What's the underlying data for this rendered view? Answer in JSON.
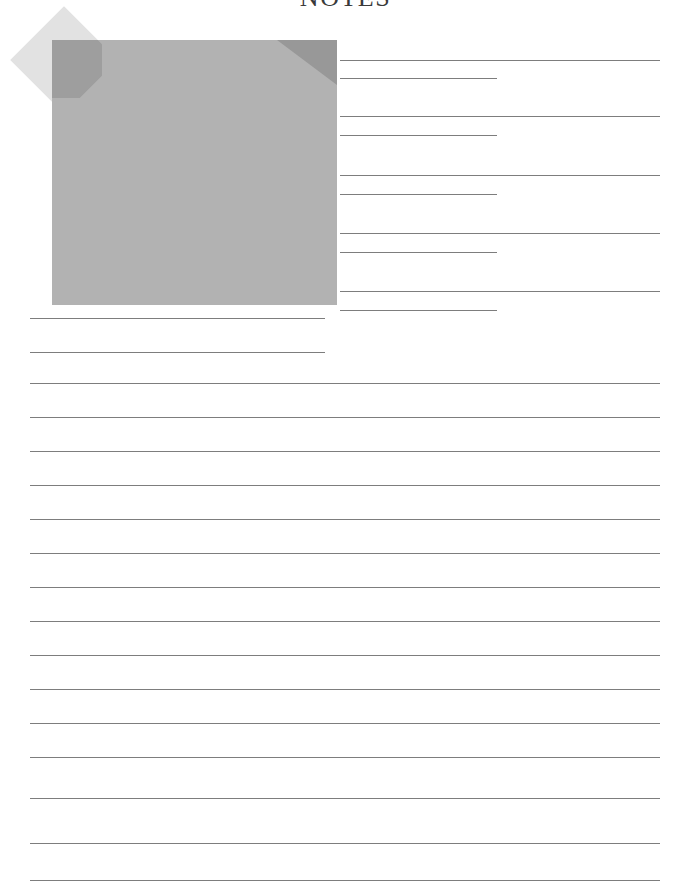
{
  "page": {
    "title": "NOTES",
    "width": 691,
    "height": 883,
    "background_color": "#ffffff",
    "title_color": "#3a3a3a"
  },
  "note_graphic": {
    "name": "sticky-note-illustration",
    "body_color": "#b2b2b2",
    "fold_color": "#989898",
    "tape_color": "#e2e2e2",
    "overlap_color": "#9e9e9e"
  },
  "rules": {
    "line_color": "#7d7d7d",
    "right_column": [
      {
        "type": "long",
        "x": 340,
        "width": 320,
        "y": 60
      },
      {
        "type": "short",
        "x": 340,
        "width": 157,
        "y": 78
      },
      {
        "type": "long",
        "x": 340,
        "width": 320,
        "y": 116
      },
      {
        "type": "short",
        "x": 340,
        "width": 157,
        "y": 135
      },
      {
        "type": "long",
        "x": 340,
        "width": 320,
        "y": 175
      },
      {
        "type": "short",
        "x": 340,
        "width": 157,
        "y": 194
      },
      {
        "type": "long",
        "x": 340,
        "width": 320,
        "y": 233
      },
      {
        "type": "short",
        "x": 340,
        "width": 157,
        "y": 252
      },
      {
        "type": "long",
        "x": 340,
        "width": 320,
        "y": 291
      },
      {
        "type": "short",
        "x": 340,
        "width": 157,
        "y": 310
      }
    ],
    "left_column": [
      {
        "type": "short",
        "x": 30,
        "width": 295,
        "y": 318
      },
      {
        "type": "short",
        "x": 30,
        "width": 295,
        "y": 352
      }
    ],
    "full_width": [
      {
        "x": 30,
        "width": 630,
        "y": 383
      },
      {
        "x": 30,
        "width": 630,
        "y": 417
      },
      {
        "x": 30,
        "width": 630,
        "y": 451
      },
      {
        "x": 30,
        "width": 630,
        "y": 485
      },
      {
        "x": 30,
        "width": 630,
        "y": 519
      },
      {
        "x": 30,
        "width": 630,
        "y": 553
      },
      {
        "x": 30,
        "width": 630,
        "y": 587
      },
      {
        "x": 30,
        "width": 630,
        "y": 621
      },
      {
        "x": 30,
        "width": 630,
        "y": 655
      },
      {
        "x": 30,
        "width": 630,
        "y": 689
      },
      {
        "x": 30,
        "width": 630,
        "y": 723
      },
      {
        "x": 30,
        "width": 630,
        "y": 757
      },
      {
        "x": 30,
        "width": 630,
        "y": 798
      },
      {
        "x": 30,
        "width": 630,
        "y": 843
      },
      {
        "x": 30,
        "width": 630,
        "y": 880
      }
    ]
  }
}
